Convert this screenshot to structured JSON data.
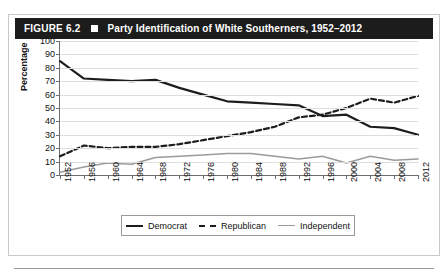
{
  "figure": {
    "number_label": "FIGURE 6.2",
    "separator_icon": "square-bullet",
    "title": "Party Identification of White Southerners, 1952–2012"
  },
  "chart_data": {
    "type": "line",
    "title": "Party Identification of White Southerners, 1952–2012",
    "xlabel": "Year",
    "ylabel": "Percentage",
    "ylim": [
      0,
      100
    ],
    "ytick_step": 10,
    "yticks": [
      100,
      90,
      80,
      70,
      60,
      50,
      40,
      30,
      20,
      10,
      0
    ],
    "grid": true,
    "legend_position": "bottom",
    "categories": [
      1952,
      1956,
      1960,
      1964,
      1968,
      1972,
      1976,
      1980,
      1984,
      1988,
      1992,
      1996,
      2000,
      2004,
      2008,
      2012
    ],
    "xtick_labels": [
      "1952",
      "1956",
      "1960",
      "1964",
      "1968",
      "1972",
      "1976",
      "1980",
      "1984",
      "1988",
      "1992",
      "1996",
      "2000",
      "2004",
      "2008",
      "2012"
    ],
    "series": [
      {
        "name": "Democrat",
        "style": "solid",
        "color": "#1d1d1d",
        "values": [
          85,
          72,
          71,
          70,
          71,
          65,
          60,
          55,
          54,
          53,
          52,
          44,
          45,
          36,
          35,
          30
        ]
      },
      {
        "name": "Republican",
        "style": "dashed",
        "color": "#1d1d1d",
        "values": [
          14,
          22,
          20,
          21,
          21,
          23,
          26,
          29,
          32,
          36,
          43,
          45,
          50,
          57,
          54,
          59
        ]
      },
      {
        "name": "Independent",
        "style": "solid",
        "color": "#9b9b9b",
        "values": [
          2,
          6,
          9,
          8,
          13,
          14,
          15,
          16,
          16,
          14,
          12,
          14,
          9,
          14,
          11,
          12
        ]
      }
    ]
  },
  "legend": {
    "items": [
      {
        "label": "Democrat",
        "swatch": "solid-dark-line"
      },
      {
        "label": "Republican",
        "swatch": "dashed-dark-line"
      },
      {
        "label": "Independent",
        "swatch": "solid-gray-line"
      }
    ]
  }
}
